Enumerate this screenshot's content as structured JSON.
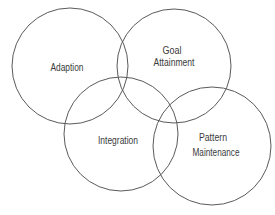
{
  "diagram": {
    "type": "venn",
    "title": "",
    "sets": [
      {
        "id": "adaption",
        "lines": [
          "Adaption"
        ]
      },
      {
        "id": "goal-attainment",
        "lines": [
          "Goal",
          "Attainment"
        ]
      },
      {
        "id": "integration",
        "lines": [
          "Integration"
        ]
      },
      {
        "id": "pattern-maintenance",
        "lines": [
          "Pattern",
          "Maintenance"
        ]
      }
    ],
    "colors": {
      "stroke": "#5a5a5a",
      "text": "#3a3a3a",
      "background": "#ffffff"
    }
  }
}
